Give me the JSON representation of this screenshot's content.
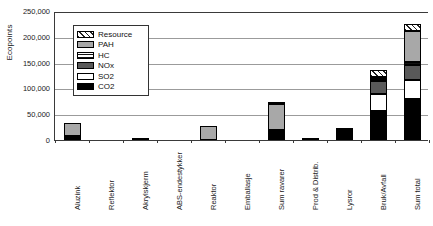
{
  "axes": {
    "ylabel": "Ecopoints",
    "yticks": [
      "250,000",
      "200,000",
      "150,000",
      "100,000",
      "50,000",
      "0"
    ]
  },
  "legend": {
    "title": "",
    "items": [
      {
        "label": "Resource",
        "swatch": "res",
        "color": "#ffffff"
      },
      {
        "label": "PAH",
        "swatch": "pah",
        "color": "#a8a8a8"
      },
      {
        "label": "HC",
        "swatch": "hc",
        "color": "#ffffff"
      },
      {
        "label": "NOx",
        "swatch": "nox",
        "color": "#595959"
      },
      {
        "label": "SO2",
        "swatch": "so2",
        "color": "#ffffff"
      },
      {
        "label": "CO2",
        "swatch": "co2",
        "color": "#000000"
      }
    ]
  },
  "caption": "",
  "chart_data": {
    "type": "bar",
    "subtype": "stacked",
    "title": "",
    "xlabel": "",
    "ylabel": "Ecopoints",
    "ylim": [
      0,
      250000
    ],
    "ytick_step": 50000,
    "grid": true,
    "legend_position": "inside-upper-left",
    "categories": [
      "Aluzink",
      "Reflektor",
      "Akrylskjerm",
      "ABS-endestykker",
      "Reaktor",
      "Emballasje",
      "Sum ravarer",
      "Prod & Distrib.",
      "Lysror",
      "Bruk/Avfall",
      "Sum total"
    ],
    "series": [
      {
        "name": "CO2",
        "values": [
          1500,
          400,
          4500,
          600,
          1000,
          300,
          8000,
          3500,
          23000,
          57000,
          80000
        ]
      },
      {
        "name": "SO2",
        "values": [
          1000,
          200,
          600,
          200,
          500,
          100,
          2500,
          500,
          0,
          33000,
          36000
        ]
      },
      {
        "name": "NOx",
        "values": [
          1500,
          200,
          500,
          200,
          800,
          100,
          3000,
          400,
          0,
          25000,
          30000
        ]
      },
      {
        "name": "HC",
        "values": [
          500,
          100,
          200,
          100,
          300,
          100,
          1200,
          200,
          0,
          1500,
          5000
        ]
      },
      {
        "name": "PAH",
        "values": [
          26000,
          600,
          700,
          500,
          27500,
          400,
          50000,
          400,
          0,
          4000,
          60000
        ]
      },
      {
        "name": "Resource",
        "values": [
          500,
          100,
          200,
          100,
          400,
          100,
          1300,
          200,
          0,
          12000,
          14000
        ]
      }
    ],
    "totals": [
      31000,
      1600,
      6700,
      1700,
      30500,
      1100,
      66000,
      5200,
      23000,
      132500,
      225000
    ]
  }
}
